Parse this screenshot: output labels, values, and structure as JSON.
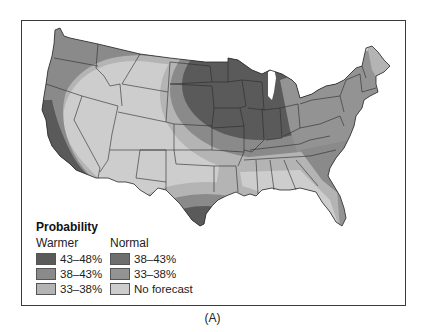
{
  "legend": {
    "title": "Probability",
    "columns": [
      {
        "heading": "Warmer",
        "items": [
          {
            "label": "43–48%",
            "color": "#5a5a5a"
          },
          {
            "label": "38–43%",
            "color": "#8a8a8a"
          },
          {
            "label": "33–38%",
            "color": "#b4b4b4"
          }
        ]
      },
      {
        "heading": "Normal",
        "items": [
          {
            "label": "38–43%",
            "color": "#6e6e6e"
          },
          {
            "label": "33–38%",
            "color": "#939393"
          },
          {
            "label": "No forecast",
            "color": "#cdcdcd"
          }
        ]
      }
    ]
  },
  "caption": "(A)",
  "colors": {
    "no_forecast": "#cdcdcd",
    "warm_33_38": "#b4b4b4",
    "warm_38_43": "#8a8a8a",
    "warm_43_48": "#5a5a5a",
    "normal_33_38": "#939393",
    "normal_38_43": "#6e6e6e",
    "border": "#2a2a2a",
    "frame": "#3a3a3a"
  }
}
